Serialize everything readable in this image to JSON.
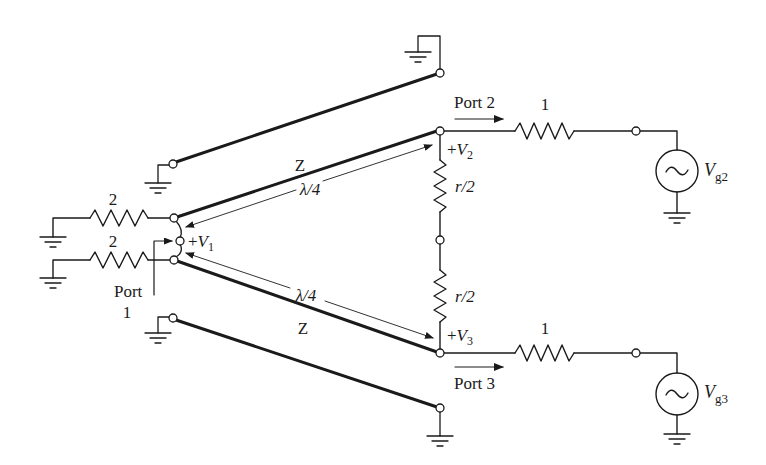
{
  "diagram": {
    "type": "wilkinson-power-divider-even-odd-analysis",
    "labels": {
      "port1_label": "Port",
      "port1_number": "1",
      "port2": "Port 2",
      "port3": "Port 3",
      "v1_plus": "+",
      "v1_sym": "V",
      "v1_sub": "1",
      "v2_plus": "+",
      "v2_sym": "V",
      "v2_sub": "2",
      "v3_plus": "+",
      "v3_sym": "V",
      "v3_sub": "3",
      "vg2_sym": "V",
      "vg2_sub": "g2",
      "vg3_sym": "V",
      "vg3_sub": "g3",
      "z_upper": "Z",
      "z_lower": "Z",
      "lambda_upper": "λ/4",
      "lambda_lower": "λ/4",
      "r_upper": "r/2",
      "r_lower": "r/2",
      "res_port1_upper": "2",
      "res_port1_lower": "2",
      "res_port2": "1",
      "res_port3": "1"
    },
    "colors": {
      "line": "#1a1a1a",
      "background": "#ffffff"
    }
  }
}
